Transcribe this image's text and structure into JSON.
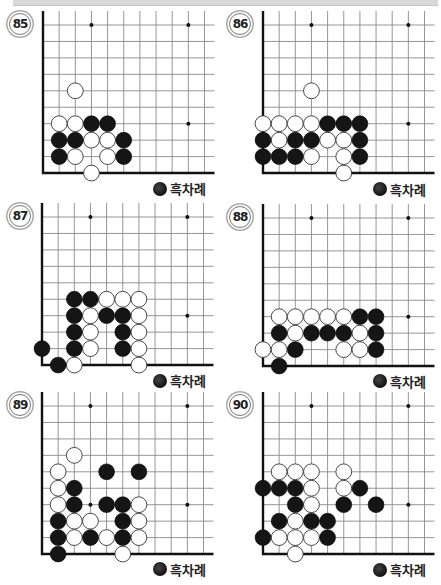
{
  "page": {
    "turn_label": "흑차례",
    "colors": {
      "black_stone": "#151515",
      "white_stone": "#ffffff",
      "grid_line": "#8a8a8a",
      "edge_line": "#111111",
      "top_bar": "#d9d9d9"
    }
  },
  "problems": [
    {
      "number": "85",
      "turn": "흑차례",
      "stones": {
        "black": [
          [
            3,
            3
          ],
          [
            4,
            3
          ],
          [
            1,
            2
          ],
          [
            2,
            2
          ],
          [
            5,
            2
          ],
          [
            1,
            1
          ],
          [
            5,
            1
          ]
        ],
        "white": [
          [
            2,
            5
          ],
          [
            1,
            3
          ],
          [
            2,
            3
          ],
          [
            3,
            2
          ],
          [
            4,
            2
          ],
          [
            2,
            1
          ],
          [
            4,
            1
          ],
          [
            3,
            0
          ]
        ]
      }
    },
    {
      "number": "86",
      "turn": "흑차례",
      "stones": {
        "black": [
          [
            4,
            3
          ],
          [
            5,
            3
          ],
          [
            6,
            3
          ],
          [
            0,
            2
          ],
          [
            2,
            2
          ],
          [
            3,
            2
          ],
          [
            6,
            2
          ],
          [
            0,
            1
          ],
          [
            1,
            1
          ],
          [
            2,
            1
          ],
          [
            6,
            1
          ]
        ],
        "white": [
          [
            3,
            5
          ],
          [
            0,
            3
          ],
          [
            1,
            3
          ],
          [
            2,
            3
          ],
          [
            3,
            3
          ],
          [
            1,
            2
          ],
          [
            4,
            2
          ],
          [
            5,
            2
          ],
          [
            3,
            1
          ],
          [
            5,
            1
          ],
          [
            5,
            0
          ]
        ]
      }
    },
    {
      "number": "87",
      "turn": "흑차례",
      "stones": {
        "black": [
          [
            2,
            4
          ],
          [
            3,
            4
          ],
          [
            2,
            3
          ],
          [
            4,
            3
          ],
          [
            5,
            3
          ],
          [
            2,
            2
          ],
          [
            5,
            2
          ],
          [
            0,
            1
          ],
          [
            2,
            1
          ],
          [
            5,
            1
          ],
          [
            1,
            0
          ]
        ],
        "white": [
          [
            4,
            4
          ],
          [
            5,
            4
          ],
          [
            6,
            4
          ],
          [
            3,
            3
          ],
          [
            6,
            3
          ],
          [
            3,
            2
          ],
          [
            6,
            2
          ],
          [
            3,
            1
          ],
          [
            6,
            1
          ],
          [
            2,
            0
          ],
          [
            6,
            0
          ]
        ]
      }
    },
    {
      "number": "88",
      "turn": "흑차례",
      "stones": {
        "black": [
          [
            6,
            3
          ],
          [
            7,
            3
          ],
          [
            1,
            2
          ],
          [
            3,
            2
          ],
          [
            4,
            2
          ],
          [
            5,
            2
          ],
          [
            7,
            2
          ],
          [
            2,
            1
          ],
          [
            7,
            1
          ],
          [
            1,
            0
          ]
        ],
        "white": [
          [
            1,
            3
          ],
          [
            2,
            3
          ],
          [
            3,
            3
          ],
          [
            4,
            3
          ],
          [
            5,
            3
          ],
          [
            2,
            2
          ],
          [
            6,
            2
          ],
          [
            0,
            1
          ],
          [
            1,
            1
          ],
          [
            5,
            1
          ],
          [
            6,
            1
          ]
        ]
      }
    },
    {
      "number": "89",
      "turn": "흑차례",
      "stones": {
        "black": [
          [
            4,
            5
          ],
          [
            6,
            5
          ],
          [
            2,
            4
          ],
          [
            2,
            3
          ],
          [
            4,
            3
          ],
          [
            5,
            3
          ],
          [
            1,
            2
          ],
          [
            5,
            2
          ],
          [
            1,
            1
          ],
          [
            3,
            1
          ],
          [
            5,
            1
          ],
          [
            1,
            0
          ]
        ],
        "white": [
          [
            2,
            6
          ],
          [
            1,
            5
          ],
          [
            1,
            4
          ],
          [
            1,
            3
          ],
          [
            6,
            3
          ],
          [
            2,
            2
          ],
          [
            3,
            2
          ],
          [
            6,
            2
          ],
          [
            2,
            1
          ],
          [
            4,
            1
          ],
          [
            6,
            1
          ],
          [
            5,
            0
          ]
        ]
      }
    },
    {
      "number": "90",
      "turn": "흑차례",
      "stones": {
        "black": [
          [
            0,
            4
          ],
          [
            1,
            4
          ],
          [
            2,
            4
          ],
          [
            6,
            4
          ],
          [
            2,
            3
          ],
          [
            5,
            3
          ],
          [
            7,
            3
          ],
          [
            1,
            2
          ],
          [
            3,
            2
          ],
          [
            4,
            2
          ],
          [
            0,
            1
          ],
          [
            4,
            1
          ]
        ],
        "white": [
          [
            1,
            5
          ],
          [
            2,
            5
          ],
          [
            3,
            5
          ],
          [
            5,
            5
          ],
          [
            3,
            4
          ],
          [
            5,
            4
          ],
          [
            3,
            3
          ],
          [
            2,
            2
          ],
          [
            1,
            1
          ],
          [
            2,
            1
          ],
          [
            3,
            1
          ],
          [
            2,
            0
          ]
        ]
      }
    }
  ],
  "board": {
    "columns": 11,
    "rows": 10,
    "star_points": [
      [
        3,
        9
      ],
      [
        9,
        9
      ],
      [
        9,
        3
      ],
      [
        3,
        3
      ]
    ]
  }
}
